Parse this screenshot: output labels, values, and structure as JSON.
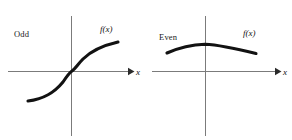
{
  "figure": {
    "background_color": "#ffffff",
    "axis_color": "#7b7b7b",
    "curve_color": "#121212",
    "text_color": "#1a1a1a"
  },
  "panels": [
    {
      "id": "odd",
      "title": "Odd",
      "function_label": "f(x)",
      "x_axis_label": "x",
      "chart": {
        "type": "line",
        "description": "Odd function through the origin, increasing, symmetric about the origin",
        "origin": {
          "x": 72,
          "y": 71
        },
        "x_axis": {
          "start": 8,
          "end": 122,
          "y": 71
        },
        "y_axis": {
          "x": 72,
          "top": 16,
          "bottom": 136
        },
        "curve_points": [
          {
            "x": 28,
            "y": 101
          },
          {
            "x": 42,
            "y": 97
          },
          {
            "x": 56,
            "y": 88
          },
          {
            "x": 66,
            "y": 78
          },
          {
            "x": 72,
            "y": 71
          },
          {
            "x": 79,
            "y": 63
          },
          {
            "x": 91,
            "y": 52
          },
          {
            "x": 104,
            "y": 46
          },
          {
            "x": 118,
            "y": 42
          }
        ]
      }
    },
    {
      "id": "even",
      "title": "Even",
      "function_label": "f(x)",
      "x_axis_label": "x",
      "chart": {
        "type": "line",
        "description": "Even function, downward opening arc, symmetric about the vertical axis",
        "origin": {
          "x": 205,
          "y": 71
        },
        "x_axis": {
          "start": 152,
          "end": 272,
          "y": 71
        },
        "y_axis": {
          "x": 205,
          "top": 16,
          "bottom": 136
        },
        "curve_points": [
          {
            "x": 167,
            "y": 53
          },
          {
            "x": 180,
            "y": 48
          },
          {
            "x": 193,
            "y": 45
          },
          {
            "x": 205,
            "y": 44
          },
          {
            "x": 218,
            "y": 45
          },
          {
            "x": 232,
            "y": 47
          },
          {
            "x": 245,
            "y": 50
          },
          {
            "x": 256,
            "y": 53
          }
        ]
      }
    }
  ],
  "labels": {
    "odd_title_pos": {
      "x": 14,
      "y": 37
    },
    "odd_fx_pos": {
      "x": 100,
      "y": 32
    },
    "odd_x_pos": {
      "x": 136,
      "y": 75
    },
    "even_title_pos": {
      "x": 159,
      "y": 40
    },
    "even_fx_pos": {
      "x": 243,
      "y": 36
    },
    "even_x_pos": {
      "x": 283,
      "y": 75
    }
  }
}
